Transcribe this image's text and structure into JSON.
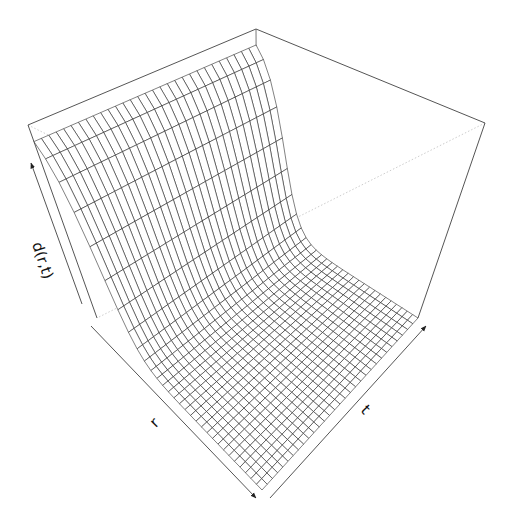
{
  "chart_data": {
    "type": "surface3d",
    "title": "",
    "xlabel": "r",
    "ylabel": "t",
    "zlabel": "d(r,t)",
    "grid": {
      "r_lines": 30,
      "t_lines": 30
    },
    "ticks": "none (axis arrows only)",
    "box": true,
    "surface": {
      "r_range": [
        0,
        1
      ],
      "t_range": [
        0,
        1
      ],
      "z_at_r0": 1.0,
      "decay_center": 0.13,
      "decay_width": 0.055,
      "z_far": 0.0
    },
    "projection": {
      "box_top_back": [
        256,
        29
      ],
      "box_top_left": [
        28,
        125
      ],
      "box_top_right": [
        485,
        123
      ],
      "floor_back": [
        257,
        215
      ],
      "floor_left": [
        97,
        318
      ],
      "floor_right": [
        418,
        318
      ],
      "floor_front": [
        262,
        490
      ]
    },
    "colors": {
      "mesh": "#1a1a1a",
      "box": "#555555",
      "hidden": "#aaaaaa",
      "background": "#ffffff"
    }
  }
}
